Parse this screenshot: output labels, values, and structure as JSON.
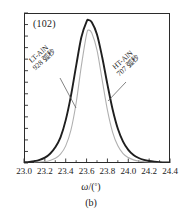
{
  "figure": {
    "caption": "(b)",
    "panel_label": "(102)",
    "axis_title_symbol": "ω",
    "axis_title_slash": "/(",
    "axis_title_unit": "°",
    "axis_title_close": ")"
  },
  "chart_data": {
    "type": "line",
    "title": "(102)",
    "xlabel": "ω/(°)",
    "ylabel": "",
    "xlim": [
      23.0,
      24.4
    ],
    "ylim": [
      0,
      1.05
    ],
    "grid": false,
    "legend_position": "inline-annotations",
    "xticks": [
      23.0,
      23.2,
      23.4,
      23.6,
      23.8,
      24.0,
      24.2,
      24.4
    ],
    "xtick_labels": [
      "23.0",
      "23.2",
      "23.4",
      "23.6",
      "23.8",
      "24.0",
      "24.2",
      "24.4"
    ],
    "x_minor_ticks_per_interval": 1,
    "yticks_unlabeled_count": 13,
    "annotations": [
      {
        "name": "LT-AlN",
        "line1": "LT-AlN",
        "line2": "928 弧秒",
        "fwhm_arcsec": 928,
        "points_to": "lt-aln-curve",
        "rotation_deg": -41
      },
      {
        "name": "HT-AlN",
        "line1": "HT-AlN",
        "line2": "707 弧秒",
        "fwhm_arcsec": 707,
        "points_to": "ht-aln-curve",
        "rotation_deg": -41
      }
    ],
    "series": [
      {
        "name": "LT-AlN",
        "label": "LT-AlN 928 弧秒",
        "color": "#1f1f1f",
        "linewidth": 1.9,
        "peak_x": 23.62,
        "peak_y": 1.0,
        "fwhm_deg": 0.258,
        "x": [
          23.0,
          23.05,
          23.1,
          23.15,
          23.2,
          23.25,
          23.3,
          23.35,
          23.4,
          23.45,
          23.5,
          23.55,
          23.6,
          23.62,
          23.65,
          23.7,
          23.75,
          23.8,
          23.85,
          23.9,
          23.95,
          24.0,
          24.05,
          24.1,
          24.15,
          24.2,
          24.25,
          24.3,
          24.4
        ],
        "y": [
          0.005,
          0.008,
          0.013,
          0.022,
          0.038,
          0.065,
          0.11,
          0.18,
          0.3,
          0.47,
          0.68,
          0.88,
          0.99,
          1.0,
          0.985,
          0.9,
          0.74,
          0.55,
          0.375,
          0.24,
          0.15,
          0.092,
          0.056,
          0.035,
          0.022,
          0.014,
          0.009,
          0.006,
          0.003
        ]
      },
      {
        "name": "HT-AlN",
        "label": "HT-AlN 707 弧秒",
        "color": "#b0b0b0",
        "linewidth": 1.1,
        "peak_x": 23.62,
        "peak_y": 0.93,
        "fwhm_deg": 0.196,
        "x": [
          23.1,
          23.2,
          23.25,
          23.3,
          23.35,
          23.4,
          23.45,
          23.5,
          23.55,
          23.6,
          23.62,
          23.65,
          23.7,
          23.75,
          23.8,
          23.85,
          23.9,
          23.95,
          24.0,
          24.05,
          24.1,
          24.2,
          24.3
        ],
        "y": [
          0.004,
          0.01,
          0.018,
          0.033,
          0.062,
          0.12,
          0.23,
          0.42,
          0.68,
          0.9,
          0.93,
          0.91,
          0.79,
          0.58,
          0.37,
          0.215,
          0.12,
          0.066,
          0.038,
          0.022,
          0.013,
          0.005,
          0.002
        ]
      }
    ],
    "leader_lines": [
      {
        "name": "lt-aln-leader",
        "from": [
          60,
          78
        ],
        "to": [
          76,
          108
        ]
      },
      {
        "name": "ht-aln-leader",
        "from": [
          126,
          82
        ],
        "to": [
          108,
          101
        ]
      }
    ]
  }
}
